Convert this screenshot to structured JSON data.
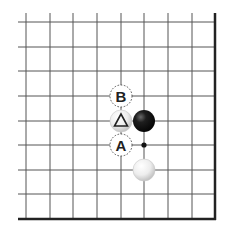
{
  "diagram": {
    "type": "go-board-corner",
    "corner": "bottom-right",
    "columns": 9,
    "rows": 9,
    "grid": {
      "x": [
        26,
        50,
        73,
        97,
        121,
        144,
        168,
        192,
        215
      ],
      "y": [
        22,
        47,
        71,
        96,
        121,
        145,
        170,
        194,
        219
      ],
      "line_start_x": 18,
      "line_start_y": 13,
      "line_color": "#555555",
      "edge_color": "#222222"
    },
    "stones": [
      {
        "color": "black",
        "col": 5,
        "row": 4,
        "mark": null
      },
      {
        "color": "white",
        "col": 4,
        "row": 4,
        "mark": "triangle"
      },
      {
        "color": "white",
        "col": 5,
        "row": 6,
        "mark": null
      }
    ],
    "labels": [
      {
        "text": "B",
        "col": 4,
        "row": 3,
        "style": "dashed-circle"
      },
      {
        "text": "A",
        "col": 4,
        "row": 5,
        "style": "dashed-circle"
      }
    ],
    "points": [
      {
        "col": 5,
        "row": 5,
        "style": "small-dot"
      }
    ]
  }
}
